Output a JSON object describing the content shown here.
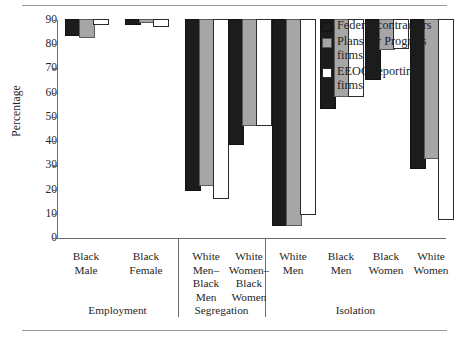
{
  "chart_data": {
    "type": "bar",
    "title": "",
    "subtitle": "",
    "xlabel": "",
    "ylabel": "Percentage",
    "ylim": [
      0,
      90
    ],
    "yticks": [
      0,
      10,
      20,
      30,
      40,
      50,
      60,
      70,
      80,
      90
    ],
    "ytick_labels": [
      "0",
      "10",
      "20",
      "30",
      "40",
      "50",
      "60",
      "70",
      "80",
      "90"
    ],
    "grid": false,
    "legend_position": "top-right",
    "categories": [
      "Black Male",
      "Black Female",
      "White Men–Black Men",
      "White Women–Black Women",
      "White Men",
      "Black Men",
      "Black Women",
      "White Women"
    ],
    "category_lines": [
      [
        "Black",
        "Male"
      ],
      [
        "Black",
        "Female"
      ],
      [
        "White",
        "Men–",
        "Black",
        "Men"
      ],
      [
        "White",
        "Women–",
        "Black",
        "Women"
      ],
      [
        "White",
        "Men"
      ],
      [
        "Black",
        "Men"
      ],
      [
        "Black",
        "Women"
      ],
      [
        "White",
        "Women"
      ]
    ],
    "groups": [
      {
        "label": "Employment",
        "categories": [
          "Black Male",
          "Black Female"
        ]
      },
      {
        "label": "Segregation",
        "categories": [
          "White Men–Black Men",
          "White Women–Black Women"
        ]
      },
      {
        "label": "Isolation",
        "categories": [
          "White Men",
          "Black Men",
          "Black Women",
          "White Women"
        ]
      }
    ],
    "series": [
      {
        "name": "Federal contractors",
        "color": "#1c1c1c",
        "values": [
          6,
          1.5,
          70,
          51,
          84.5,
          36.5,
          24.5,
          61
        ]
      },
      {
        "name": "Plans for Progress firms",
        "color": "#a6a6a6",
        "values": [
          7,
          1,
          68,
          43.5,
          84.5,
          31.5,
          12,
          57
        ]
      },
      {
        "name": "EEOC-reporting firms",
        "color": "#ffffff",
        "values": [
          1.5,
          2.5,
          73.5,
          43.5,
          80,
          31.5,
          11.5,
          82
        ]
      }
    ]
  },
  "legend": {
    "entries": [
      {
        "swatch": "filled-black-square",
        "label": "Federal contractors"
      },
      {
        "swatch": "filled-gray-square",
        "label": "Plans for Progress firms"
      },
      {
        "swatch": "open-white-square",
        "label": "EEOC-reporting firms"
      }
    ],
    "wrapped": [
      [
        "Federal contractors"
      ],
      [
        "Plans for Progress",
        "firms"
      ],
      [
        "EEOC-reporting",
        "firms"
      ]
    ]
  }
}
